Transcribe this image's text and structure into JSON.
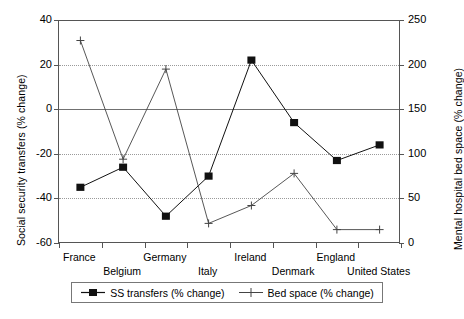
{
  "chart_data": {
    "type": "line",
    "title": "",
    "categories": [
      "France",
      "Belgium",
      "Germany",
      "Italy",
      "Ireland",
      "Denmark",
      "England",
      "United States"
    ],
    "series": [
      {
        "name": "SS transfers  (% change)",
        "axis": "left",
        "marker": "filled-square",
        "values": [
          -35,
          -26,
          -48,
          -30,
          22,
          -6,
          -23,
          -16
        ]
      },
      {
        "name": "Bed space  (% change)",
        "axis": "right",
        "marker": "plus",
        "values": [
          227,
          94,
          195,
          22,
          42,
          78,
          15,
          15
        ]
      }
    ],
    "xlabel": "",
    "ylabel": "Social security transfers (% change)",
    "y2label": "Mental hospital bed space (% change)",
    "ylim": [
      -60,
      40
    ],
    "y2lim": [
      0,
      250
    ],
    "yticks": [
      40,
      20,
      0,
      -20,
      -40,
      -60
    ],
    "y2ticks": [
      250,
      200,
      150,
      100,
      50,
      0
    ],
    "ytick_labels": [
      "40",
      "20",
      "0",
      "-20",
      "-40",
      "-60"
    ],
    "y2tick_labels": [
      "250",
      "200",
      "150",
      "100",
      "50",
      "0"
    ],
    "grid": true,
    "legend_position": "bottom"
  },
  "axes": {
    "left_title": "Social security transfers (% change)",
    "right_title": "Mental hospital bed space (% change)"
  },
  "legend": {
    "entries": [
      {
        "label": "SS transfers  (% change)",
        "marker": "filled-square"
      },
      {
        "label": "Bed space  (% change)",
        "marker": "plus"
      }
    ]
  },
  "colors": {
    "series1": "#111111",
    "series2": "#444444",
    "axis": "#555555",
    "grid": "#9a9a9a",
    "background": "#ffffff"
  }
}
